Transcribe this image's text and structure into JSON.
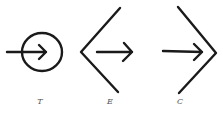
{
  "figures": [
    {
      "id": "T",
      "label": "T",
      "shape": "circle-with-arrow",
      "label_x": 40
    },
    {
      "id": "E",
      "label": "E",
      "shape": "left-chevron-with-arrow",
      "label_x": 110
    },
    {
      "id": "C",
      "label": "C",
      "shape": "right-chevron-with-arrow",
      "label_x": 180
    }
  ],
  "colors": {
    "ink": "#1a1a1a",
    "label": "#555555",
    "background": "#ffffff"
  }
}
